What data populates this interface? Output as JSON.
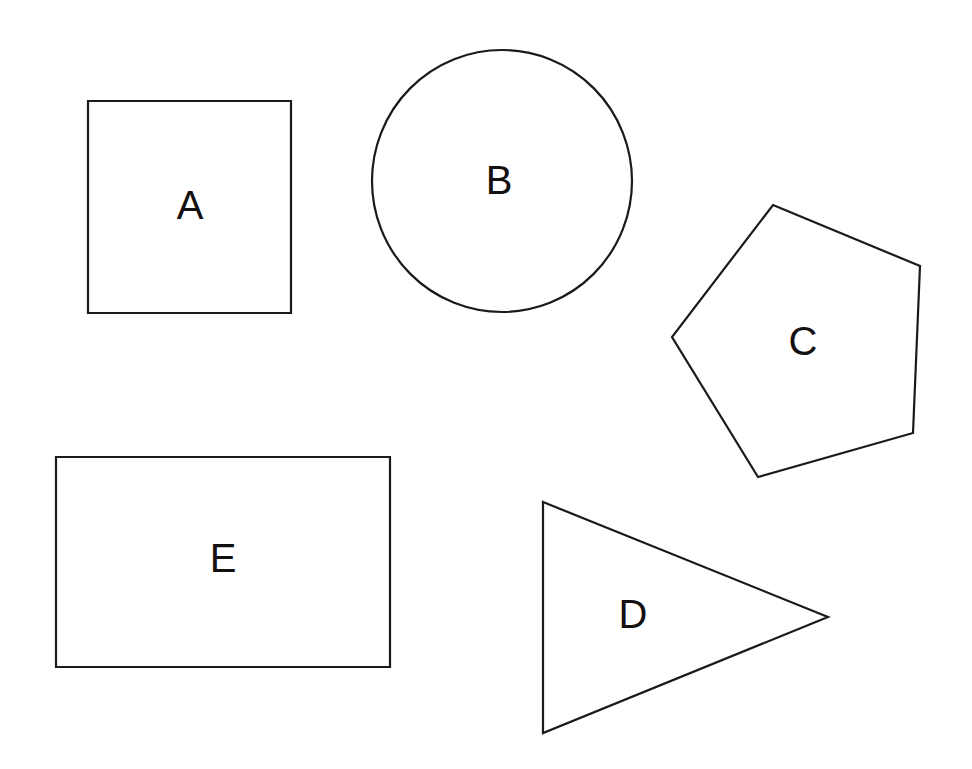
{
  "page": {
    "width": 972,
    "height": 769,
    "background_color": "#ffffff",
    "stroke_color": "#1a1a1a",
    "label_color": "#14100f",
    "stroke_width": 2.2
  },
  "shapes": [
    {
      "id": "shape-a",
      "label": "A",
      "kind": "square",
      "label_x": 190,
      "label_y": 205,
      "geometry": {
        "x": 88,
        "y": 101,
        "width": 203,
        "height": 212
      }
    },
    {
      "id": "shape-b",
      "label": "B",
      "kind": "circle",
      "label_x": 499,
      "label_y": 180,
      "geometry": {
        "cx": 502,
        "cy": 181,
        "rx": 130,
        "ry": 131
      }
    },
    {
      "id": "shape-c",
      "label": "C",
      "kind": "pentagon",
      "label_x": 803,
      "label_y": 341,
      "geometry": {
        "points": "773,205 920,266 913,433 758,477 672,337"
      }
    },
    {
      "id": "shape-d",
      "label": "D",
      "kind": "triangle",
      "label_x": 633,
      "label_y": 614,
      "geometry": {
        "points": "543,502 828,617 543,733"
      }
    },
    {
      "id": "shape-e",
      "label": "E",
      "kind": "rectangle",
      "label_x": 223,
      "label_y": 558,
      "geometry": {
        "x": 56,
        "y": 457,
        "width": 334,
        "height": 210
      }
    }
  ]
}
